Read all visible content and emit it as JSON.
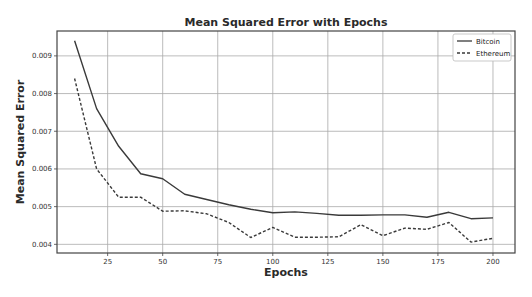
{
  "chart_data": {
    "type": "line",
    "title": "Mean Squared Error with Epochs",
    "xlabel": "Epochs",
    "ylabel": "Mean Squared Error",
    "x": [
      10,
      20,
      30,
      40,
      50,
      60,
      70,
      80,
      90,
      100,
      110,
      120,
      130,
      140,
      150,
      160,
      170,
      180,
      190,
      200
    ],
    "series": [
      {
        "name": "Bitcoin",
        "style": "solid",
        "color": "#3a3a3a",
        "values": [
          0.0094,
          0.0076,
          0.0066,
          0.00587,
          0.00574,
          0.00533,
          0.00519,
          0.00505,
          0.00493,
          0.00484,
          0.00486,
          0.00482,
          0.00477,
          0.00477,
          0.00478,
          0.00478,
          0.00472,
          0.00485,
          0.00468,
          0.0047
        ]
      },
      {
        "name": "Ethereum",
        "style": "dashed",
        "color": "#3a3a3a",
        "values": [
          0.0084,
          0.006,
          0.00525,
          0.00525,
          0.00488,
          0.00489,
          0.00481,
          0.00458,
          0.00418,
          0.00445,
          0.00419,
          0.00419,
          0.0042,
          0.00452,
          0.00423,
          0.00443,
          0.0044,
          0.00458,
          0.00406,
          0.00416
        ]
      }
    ],
    "xticks": [
      25,
      50,
      75,
      100,
      125,
      150,
      175,
      200
    ],
    "yticks": [
      0.004,
      0.005,
      0.006,
      0.007,
      0.008,
      0.009
    ],
    "ytick_labels": [
      "0.004",
      "0.005",
      "0.006",
      "0.007",
      "0.008",
      "0.009"
    ],
    "xlim": [
      2,
      210
    ],
    "ylim": [
      0.00377,
      0.00966
    ],
    "grid": true,
    "legend_position": "upper right"
  }
}
